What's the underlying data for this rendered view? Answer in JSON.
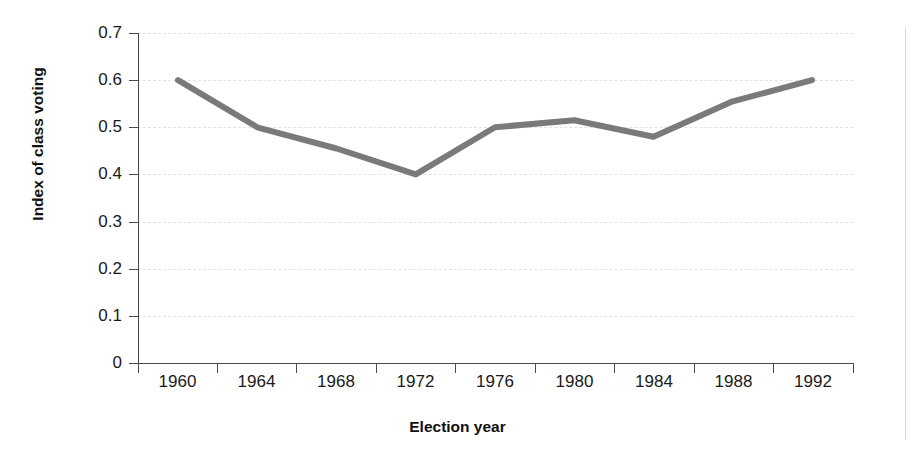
{
  "chart_data": {
    "type": "line",
    "title": "",
    "xlabel": "Election year",
    "ylabel": "Index of class voting",
    "categories": [
      "1960",
      "1964",
      "1968",
      "1972",
      "1976",
      "1980",
      "1984",
      "1988",
      "1992"
    ],
    "values": [
      0.6,
      0.5,
      0.455,
      0.4,
      0.5,
      0.515,
      0.48,
      0.555,
      0.6
    ],
    "series": [
      {
        "name": "Index of class voting",
        "values": [
          0.6,
          0.5,
          0.455,
          0.4,
          0.5,
          0.515,
          0.48,
          0.555,
          0.6
        ]
      }
    ],
    "ylim": [
      0,
      0.7
    ],
    "y_ticks": [
      "0.7",
      "0.6",
      "0.5",
      "0.4",
      "0.3",
      "0.2",
      "0.1",
      "0"
    ],
    "y_tick_values": [
      0.7,
      0.6,
      0.5,
      0.4,
      0.3,
      0.2,
      0.1,
      0
    ],
    "x_tick_labels": [
      "1960",
      "1964",
      "1968",
      "1972",
      "1976",
      "1980",
      "1984",
      "1988",
      "1992"
    ],
    "grid": "horizontal-dashed",
    "legend": "none",
    "line_color": "#7a7a7a",
    "axis_color": "#4a4a4a",
    "grid_color": "#e3e3e3",
    "text_color": "#1a1a1a"
  }
}
